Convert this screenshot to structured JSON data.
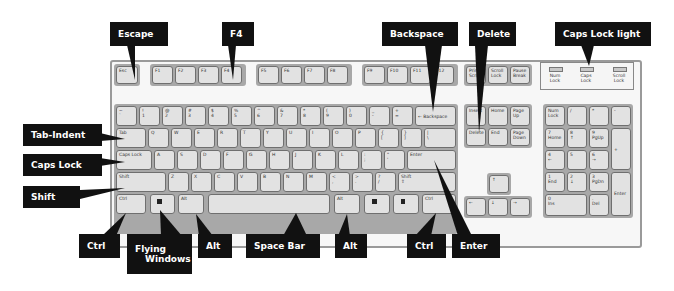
{
  "diagram": {
    "type": "labeled keyboard diagram",
    "colors": {
      "callout_bg": "#111111",
      "callout_text": "#ffffff",
      "key_face": "#e2e2e2",
      "key_border": "#6f6f6f",
      "board_bg": "#f7f7f7"
    },
    "callouts": {
      "escape": "Escape",
      "f4": "F4",
      "backspace": "Backspace",
      "delete": "Delete",
      "caps_lock_light": "Caps Lock light",
      "tab_indent": "Tab-Indent",
      "caps_lock": "Caps Lock",
      "shift": "Shift",
      "ctrl_left": "Ctrl",
      "flying_windows_1": "Flying",
      "flying_windows_2": "Windows",
      "alt_left": "Alt",
      "space_bar": "Space Bar",
      "alt_right": "Alt",
      "ctrl_right": "Ctrl",
      "enter": "Enter"
    },
    "keys": {
      "esc": "Esc",
      "f": [
        "F1",
        "F2",
        "F3",
        "F4",
        "F5",
        "F6",
        "F7",
        "F8",
        "F9",
        "F10",
        "F11",
        "F12"
      ],
      "sys": [
        "Print\nScrn",
        "Scroll\nLock",
        "Pause\nBreak"
      ],
      "number_row": [
        "~\n`",
        "!\n1",
        "@\n2",
        "#\n3",
        "$\n4",
        "%\n5",
        "^\n6",
        "&\n7",
        "*\n8",
        "(\n9",
        ")\n0",
        "_\n-",
        "+\n="
      ],
      "backspace": "← Backspace",
      "tab": "Tab",
      "qrow": [
        "Q",
        "W",
        "E",
        "R",
        "T",
        "Y",
        "U",
        "I",
        "O",
        "P",
        "{\n[",
        "}\n]",
        "|\n\\"
      ],
      "caps": "Caps Lock",
      "arow": [
        "A",
        "S",
        "D",
        "F",
        "G",
        "H",
        "J",
        "K",
        "L",
        ":\n;",
        "\"\n'"
      ],
      "enter": "Enter",
      "shift": "Shift",
      "zrow": [
        "Z",
        "X",
        "C",
        "V",
        "B",
        "N",
        "M",
        "<\n,",
        ">\n.",
        "?\n/"
      ],
      "shift_r": "Shift\n⇧",
      "ctrl": "Ctrl",
      "alt": "Alt",
      "nav_top": [
        "Insert",
        "Home",
        "Page\nUp"
      ],
      "nav_bottom": [
        "Delete",
        "End",
        "Page\nDown"
      ],
      "arrows": [
        "↑",
        "←",
        "↓",
        "→"
      ],
      "numpad_row1": [
        "Num\nLock",
        "/",
        "*",
        "-"
      ],
      "numpad_row2": [
        "7\nHome",
        "8\n↑",
        "9\nPgUp"
      ],
      "numpad_row3": [
        "4\n←",
        "5",
        "6\n→"
      ],
      "numpad_row4": [
        "1\nEnd",
        "2\n↓",
        "3\nPgDn"
      ],
      "numpad_plus": "+",
      "numpad_enter": "Enter",
      "numpad_0": "0\nIns",
      "numpad_dot": ".\nDel"
    },
    "leds": [
      "Num\nLock",
      "Caps\nLock",
      "Scroll\nLock"
    ]
  }
}
